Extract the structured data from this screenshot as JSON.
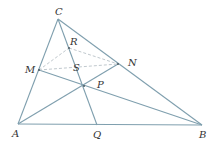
{
  "diagram": {
    "type": "geometry-triangle",
    "colors": {
      "line": "#7f9fae",
      "dashed": "#b9c2c7",
      "label": "#333333"
    },
    "points": {
      "A": {
        "x": 18,
        "y": 124,
        "label": "A"
      },
      "B": {
        "x": 202,
        "y": 125,
        "label": "B"
      },
      "C": {
        "x": 58,
        "y": 19,
        "label": "C"
      },
      "M": {
        "x": 39,
        "y": 70,
        "label": "M"
      },
      "N": {
        "x": 118,
        "y": 64,
        "label": "N"
      },
      "R": {
        "x": 69,
        "y": 48,
        "label": "R"
      },
      "S": {
        "x": 77,
        "y": 67,
        "label": "S"
      },
      "P": {
        "x": 84,
        "y": 86,
        "label": "P"
      },
      "Q": {
        "x": 97,
        "y": 125,
        "label": "Q"
      }
    },
    "solid_segments": [
      "AB",
      "BC",
      "CA",
      "AN",
      "BM",
      "CQ"
    ],
    "dashed_segments": [
      "MR",
      "RN",
      "MN"
    ]
  }
}
